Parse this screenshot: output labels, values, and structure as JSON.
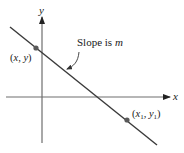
{
  "figure": {
    "type": "line-slope-diagram",
    "axes": {
      "x_label": "x",
      "y_label": "y"
    },
    "annotation": {
      "prefix": "Slope is ",
      "variable": "m"
    },
    "points": [
      {
        "label_open": "(",
        "var_a": "x",
        "sep": ", ",
        "var_b": "y",
        "label_close": ")"
      },
      {
        "label_open": "(",
        "var_a": "x",
        "sub_a": "1",
        "sep": ", ",
        "var_b": "y",
        "sub_b": "1",
        "label_close": ")"
      }
    ],
    "colors": {
      "axis": "#6e6e6e",
      "line": "#3a3a3a",
      "point": "#5a5a5a",
      "text": "#1a1a1a"
    }
  }
}
